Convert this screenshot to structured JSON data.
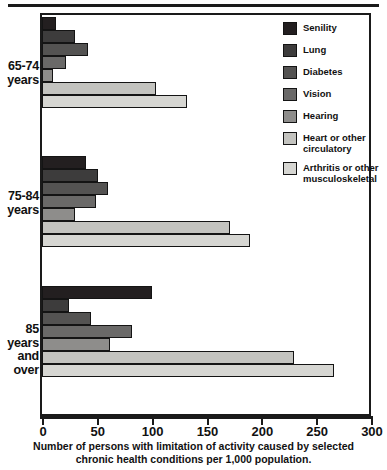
{
  "chart_data": {
    "type": "bar",
    "orientation": "horizontal",
    "title": "",
    "caption": "Number of persons with limitation of activity caused by selected\nchronic health conditions per 1,000 population.",
    "xlabel": "",
    "ylabel": "",
    "xlim": [
      0,
      300
    ],
    "xticks": [
      0,
      50,
      100,
      150,
      200,
      250,
      300
    ],
    "xtick_labels": [
      "0",
      "50",
      "100",
      "150",
      "200",
      "250",
      "300"
    ],
    "grid": false,
    "legend_position": "top-right",
    "categories": [
      "65-74 years",
      "75-84 years",
      "85 years and over"
    ],
    "category_labels": [
      "65-74\nyears",
      "75-84\nyears",
      "85\nyears\nand\nover"
    ],
    "series": [
      {
        "name": "Senility",
        "color": "#231f20",
        "values": [
          13,
          40,
          100
        ]
      },
      {
        "name": "Lung",
        "color": "#3d3c3c",
        "values": [
          30,
          51,
          25
        ]
      },
      {
        "name": "Diabetes",
        "color": "#545352",
        "values": [
          42,
          60,
          45
        ]
      },
      {
        "name": "Vision",
        "color": "#6a6968",
        "values": [
          22,
          49,
          82
        ]
      },
      {
        "name": "Hearing",
        "color": "#8e8d8b",
        "values": [
          10,
          30,
          62
        ]
      },
      {
        "name": "Heart or other\ncirculatory",
        "color": "#c3c3bf",
        "values": [
          104,
          171,
          230
        ]
      },
      {
        "name": "Arthritis or other\nmusculoskeletal",
        "color": "#d6d6d2",
        "values": [
          132,
          190,
          266
        ]
      }
    ]
  },
  "legend": {
    "items": [
      {
        "label": "Senility",
        "color": "#231f20"
      },
      {
        "label": "Lung",
        "color": "#3d3c3c"
      },
      {
        "label": "Diabetes",
        "color": "#545352"
      },
      {
        "label": "Vision",
        "color": "#6a6968"
      },
      {
        "label": "Hearing",
        "color": "#8e8d8b"
      },
      {
        "label": "Heart or other\ncirculatory",
        "color": "#c3c3bf"
      },
      {
        "label": "Arthritis or other\nmusculoskeletal",
        "color": "#d6d6d2"
      }
    ]
  },
  "axis": {
    "tick_labels": [
      "0",
      "50",
      "100",
      "150",
      "200",
      "250",
      "300"
    ]
  },
  "groups": [
    {
      "label": "65-74\nyears"
    },
    {
      "label": "75-84\nyears"
    },
    {
      "label": "85\nyears\nand\nover"
    }
  ],
  "caption": {
    "line1": "Number of persons with limitation of activity caused by selected",
    "line2": "chronic health conditions per 1,000 population."
  },
  "colors": {
    "frame": "#1a1a1a",
    "background": "#ffffff",
    "text": "#111111"
  }
}
